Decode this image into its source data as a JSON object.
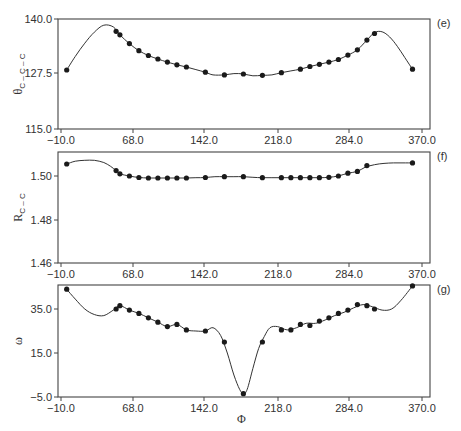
{
  "chart_data": [
    {
      "panel": "e",
      "type": "line",
      "ylabel": "θC−C−C",
      "xlabel": "",
      "xticks": [
        "-10.0",
        "68.0",
        "142.0",
        "218.0",
        "284.0",
        "370.0"
      ],
      "yticks": [
        "115.0",
        "127.5",
        "140.0"
      ],
      "xlim": [
        -15,
        378
      ],
      "ylim": [
        115.0,
        140.0
      ],
      "points_x": [
        -4,
        48,
        52,
        62,
        72,
        82,
        92,
        102,
        112,
        122,
        142,
        162,
        182,
        202,
        222,
        242,
        252,
        262,
        272,
        282,
        292,
        302,
        312,
        320,
        360
      ],
      "points_y": [
        128.4,
        137.2,
        136.4,
        134.4,
        132.8,
        131.7,
        130.9,
        130.2,
        129.6,
        129.1,
        127.9,
        127.3,
        127.5,
        127.2,
        127.8,
        128.6,
        129.2,
        129.7,
        130.2,
        130.8,
        131.8,
        133.0,
        135.2,
        136.7,
        128.6
      ],
      "curve_x": [
        -4,
        5,
        15,
        25,
        35,
        45,
        52,
        62,
        72,
        82,
        92,
        102,
        112,
        122,
        132,
        142,
        150,
        162,
        172,
        182,
        192,
        202,
        212,
        222,
        232,
        242,
        252,
        262,
        272,
        282,
        292,
        302,
        312,
        320,
        328,
        336,
        344,
        352,
        360
      ],
      "curve_y": [
        128.4,
        131.5,
        134.5,
        137.0,
        138.6,
        138.2,
        136.4,
        134.4,
        132.8,
        131.7,
        130.9,
        130.2,
        129.6,
        129.1,
        128.5,
        127.9,
        127.3,
        127.3,
        127.6,
        127.5,
        127.1,
        127.2,
        127.3,
        127.8,
        128.2,
        128.6,
        129.2,
        129.7,
        130.2,
        130.8,
        131.8,
        133.0,
        135.2,
        136.9,
        137.1,
        135.9,
        133.8,
        131.2,
        128.6
      ]
    },
    {
      "panel": "f",
      "type": "line",
      "ylabel": "RC−C",
      "xlabel": "",
      "xticks": [
        "-10.0",
        "68.0",
        "142.0",
        "218.0",
        "284.0",
        "370.0"
      ],
      "yticks": [
        "1.46",
        "1.48",
        "1.50"
      ],
      "xlim": [
        -15,
        378
      ],
      "ylim": [
        1.46,
        1.514
      ],
      "points_x": [
        -4,
        48,
        52,
        62,
        72,
        82,
        92,
        102,
        112,
        122,
        142,
        162,
        182,
        202,
        222,
        232,
        242,
        252,
        262,
        272,
        282,
        292,
        302,
        312,
        360
      ],
      "points_y": [
        1.5055,
        1.5025,
        1.501,
        1.5,
        1.4993,
        1.4991,
        1.4991,
        1.4991,
        1.4991,
        1.4991,
        1.4993,
        1.4997,
        1.4997,
        1.4992,
        1.4992,
        1.4992,
        1.4992,
        1.4992,
        1.4992,
        1.4994,
        1.5,
        1.5013,
        1.5021,
        1.5048,
        1.506
      ],
      "curve_x": [
        -4,
        5,
        15,
        25,
        35,
        42,
        48,
        52,
        62,
        72,
        82,
        92,
        102,
        112,
        122,
        132,
        142,
        152,
        162,
        172,
        182,
        192,
        202,
        212,
        222,
        232,
        242,
        252,
        262,
        272,
        282,
        292,
        302,
        310,
        320,
        330,
        340,
        350,
        360
      ],
      "curve_y": [
        1.5055,
        1.5068,
        1.5072,
        1.5072,
        1.5062,
        1.5045,
        1.5025,
        1.501,
        1.5,
        1.4993,
        1.4991,
        1.4991,
        1.4991,
        1.4991,
        1.4991,
        1.4992,
        1.4993,
        1.4997,
        1.4997,
        1.4997,
        1.4997,
        1.4994,
        1.4992,
        1.4992,
        1.4992,
        1.4992,
        1.4992,
        1.4992,
        1.4992,
        1.4994,
        1.5,
        1.5013,
        1.5021,
        1.504,
        1.5052,
        1.5058,
        1.506,
        1.506,
        1.506
      ]
    },
    {
      "panel": "g",
      "type": "line",
      "ylabel": "ω",
      "xlabel": "Φ",
      "xticks": [
        "-10.0",
        "68.0",
        "142.0",
        "218.0",
        "284.0",
        "370.0"
      ],
      "yticks": [
        "-5.0",
        "15.0",
        "35.0"
      ],
      "xlim": [
        -15,
        378
      ],
      "ylim": [
        -5.0,
        46.0
      ],
      "points_x": [
        -4,
        48,
        52,
        62,
        72,
        82,
        92,
        102,
        112,
        122,
        142,
        162,
        182,
        202,
        222,
        232,
        242,
        252,
        262,
        272,
        282,
        292,
        302,
        312,
        320,
        360
      ],
      "points_y": [
        44.0,
        35.0,
        36.5,
        34.5,
        33.0,
        31.0,
        29.0,
        27.0,
        28.0,
        25.5,
        25.0,
        20.0,
        -3.5,
        20.0,
        25.5,
        25.5,
        28.0,
        27.5,
        29.5,
        31.0,
        33.0,
        34.5,
        37.0,
        36.5,
        35.0,
        45.5
      ],
      "curve_x": [
        -4,
        5,
        15,
        25,
        35,
        45,
        52,
        62,
        72,
        82,
        92,
        102,
        112,
        122,
        132,
        142,
        150,
        158,
        165,
        172,
        178,
        182,
        186,
        192,
        198,
        204,
        210,
        218,
        228,
        238,
        248,
        258,
        268,
        278,
        288,
        298,
        308,
        318,
        328,
        338,
        348,
        360
      ],
      "curve_y": [
        44.0,
        39.5,
        35.0,
        32.5,
        32.0,
        34.5,
        36.5,
        34.5,
        33.0,
        31.0,
        29.0,
        27.0,
        28.0,
        25.5,
        25.0,
        25.0,
        26.5,
        23.0,
        15.0,
        5.0,
        -1.5,
        -3.5,
        -1.5,
        8.0,
        17.0,
        22.5,
        26.5,
        27.0,
        25.5,
        26.5,
        28.5,
        28.5,
        30.0,
        32.0,
        33.5,
        35.5,
        37.0,
        36.0,
        34.5,
        35.0,
        39.0,
        45.5
      ]
    }
  ],
  "panels": {
    "e": {
      "tag": "(e)",
      "ylabel_main": "θ",
      "ylabel_sub": "C – C – C",
      "yticks": [
        "140.0",
        "127.5",
        "115.0"
      ]
    },
    "f": {
      "tag": "(f)",
      "ylabel_main": "R",
      "ylabel_sub": "C – C",
      "yticks": [
        "1.50",
        "1.48",
        "1.46"
      ]
    },
    "g": {
      "tag": "(g)",
      "ylabel_main": "ω",
      "yticks": [
        "35.0",
        "15.0",
        "-5.0"
      ],
      "xlabel": "Φ"
    }
  },
  "xticks": [
    "−10.0",
    "68.0",
    "142.0",
    "218.0",
    "284.0",
    "370.0"
  ]
}
